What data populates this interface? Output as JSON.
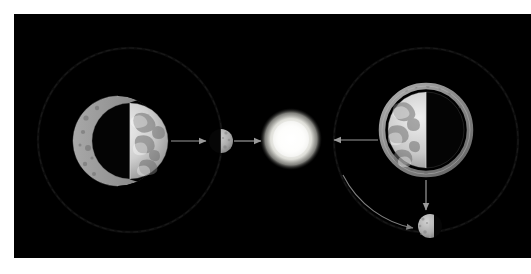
{
  "figure": {
    "background_color": "#ffffff",
    "sky_color": "#000000",
    "sky": {
      "x": 14,
      "y": 14,
      "width": 517,
      "height": 244
    }
  },
  "palette": {
    "space_black": "#000000",
    "orbit_stroke": "#2a2a2a",
    "arrow_stroke": "#9a9a9a",
    "sun_core": "#ffffff",
    "sun_mid": "#f2f2ee",
    "sun_outer": "#bdbdb8",
    "earth_lit": "#d8d8d8",
    "earth_dark": "#050505",
    "earth_rim": "#8c8c8c",
    "moon_lit": "#b9b9b9",
    "moon_shadow": "#0a0a0a",
    "crescent_gray": "#9c9c9c"
  },
  "scene": {
    "sun": {
      "name": "Sun",
      "cx": 277,
      "cy": 125,
      "r": 26,
      "glow_r": 31,
      "label": "Sun"
    },
    "left_system": {
      "name": "Left Earth-Moon system",
      "orbit": {
        "cx": 116,
        "cy": 126,
        "r": 92,
        "stroke": "#262626",
        "dashed": true
      },
      "earth": {
        "name": "Earth (left)",
        "cx": 116,
        "cy": 127,
        "r": 38,
        "lit_side": "right",
        "label": "Earth"
      },
      "big_crescent_moon": {
        "name": "Crescent Moon silhouette (left)",
        "cx": 104,
        "cy": 127,
        "r": 45,
        "lit_side": "left",
        "label": "Moon crescent"
      },
      "small_moon": {
        "name": "Half Moon at orbit right (left system)",
        "cx": 207,
        "cy": 127,
        "r": 12,
        "lit_side": "right",
        "label": "Moon"
      },
      "arrows": [
        {
          "name": "earth-to-moon-arrow",
          "x1": 157,
          "y1": 127,
          "x2": 194,
          "y2": 127,
          "direction": "right"
        },
        {
          "name": "moon-to-sun-arrow",
          "x1": 219,
          "y1": 127,
          "x2": 248,
          "y2": 127,
          "direction": "right"
        }
      ]
    },
    "right_system": {
      "name": "Right Earth-Moon system",
      "orbit": {
        "cx": 412,
        "cy": 126,
        "r": 92,
        "stroke": "#262626",
        "dashed": true
      },
      "earth": {
        "name": "Earth (right)",
        "cx": 412,
        "cy": 116,
        "r": 38,
        "lit_side": "left",
        "label": "Earth"
      },
      "moon_ring": {
        "name": "Moon ring around Earth (right)",
        "cx": 412,
        "cy": 116,
        "r": 44,
        "label": "Moon ring"
      },
      "small_moon": {
        "name": "Half Moon below (right system)",
        "cx": 420,
        "cy": 212,
        "r": 12,
        "lit_side": "left",
        "label": "Moon"
      },
      "arrows": [
        {
          "name": "earth-to-sun-arrow",
          "x1": 362,
          "y1": 126,
          "x2": 318,
          "y2": 126,
          "direction": "left"
        },
        {
          "name": "earth-to-moon-down-arrow",
          "x1": 412,
          "y1": 166,
          "x2": 412,
          "y2": 198,
          "direction": "down"
        }
      ],
      "orbit_motion_arrow": {
        "name": "orbital-motion-curved-arrow",
        "description": "curved arrow sweeping from upper-left of orbit down to the lower Moon",
        "direction": "clockwise-to-moon"
      }
    }
  },
  "legend": {
    "items": [
      {
        "key": "sun",
        "label": "Sun"
      },
      {
        "key": "earth",
        "label": "Earth"
      },
      {
        "key": "moon",
        "label": "Moon"
      },
      {
        "key": "orbit",
        "label": "Lunar orbit"
      },
      {
        "key": "sunlight",
        "label": "Direction to Sun"
      }
    ]
  }
}
